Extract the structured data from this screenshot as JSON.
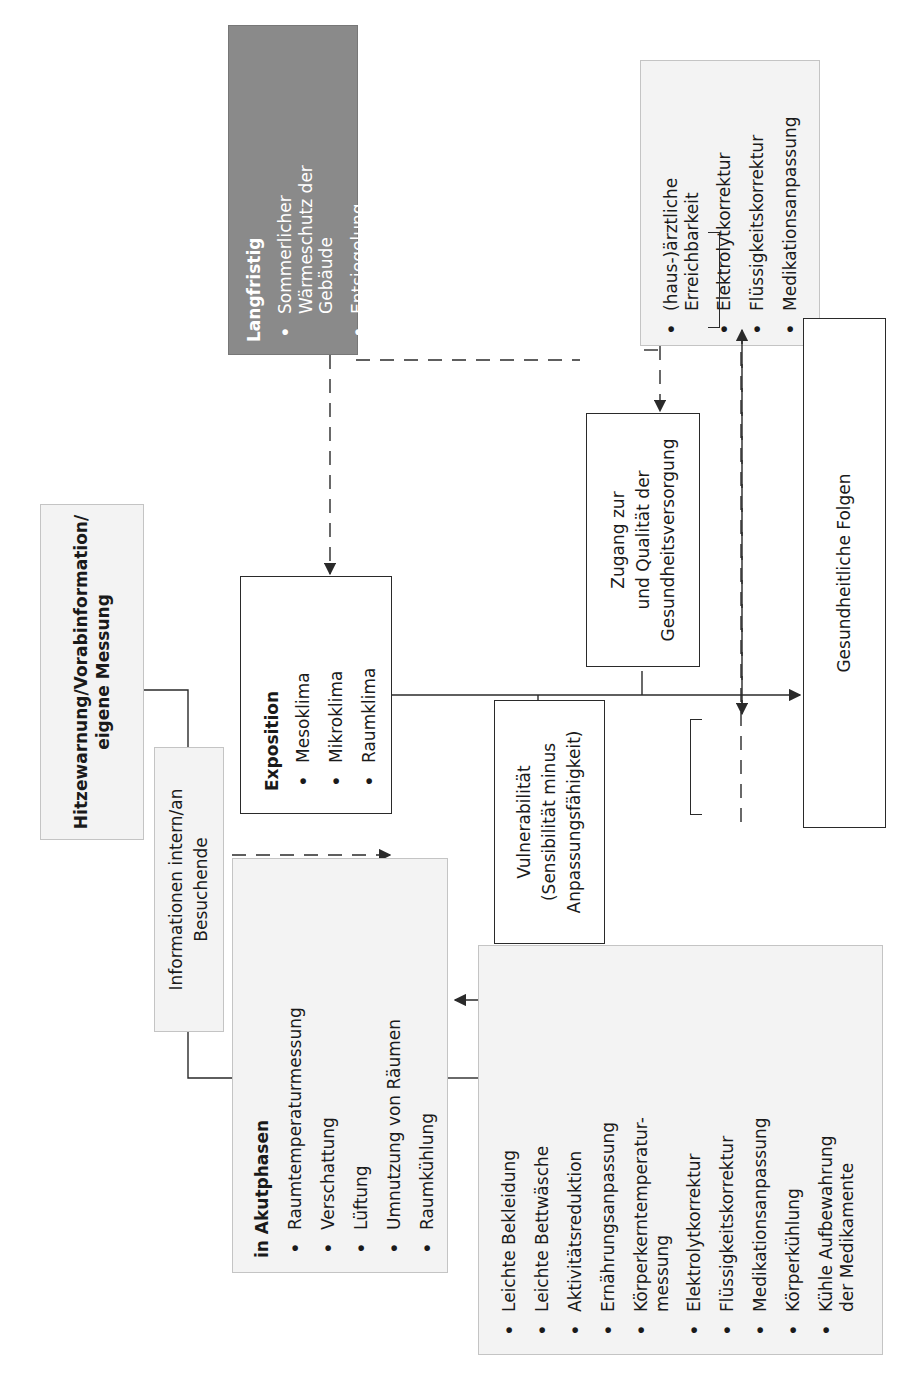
{
  "diagram": {
    "orientation": "rotated 90 degrees counter-clockwise",
    "colors": {
      "grey_box_fill": "#f3f3f3",
      "dark_box_fill": "#8a8a8a",
      "line": "#2a2a2a"
    },
    "heat_warning": {
      "label": "Hitzewarnung/Vorabinformation/\neigene Messung"
    },
    "information": {
      "label": "Informationen intern/an\nBesuchende"
    },
    "acute_phases": {
      "title": "in Akutphasen",
      "items": [
        "Raumtemperaturmessung",
        "Verschattung",
        "Lüftung",
        "Umnutzung von Räumen",
        "Raumkühlung"
      ]
    },
    "personal_measures": {
      "items": [
        {
          "text": "Leichte Bekleidung"
        },
        {
          "text": "Leichte Bettwäsche"
        },
        {
          "text": "Aktivitätsreduktion"
        },
        {
          "text": "Ernährungsanpassung"
        },
        {
          "text": "Körperkerntemperatur-",
          "continuation": "messung"
        },
        {
          "text": "Elektrolytkorrektur"
        },
        {
          "text": "Flüssigkeitskorrektur"
        },
        {
          "text": "Medikationsanpassung"
        },
        {
          "text": "Körperkühlung"
        },
        {
          "text": "Kühle Aufbewahrung",
          "continuation": "der Medikamente"
        }
      ]
    },
    "long_term": {
      "title": "Langfristig",
      "items": [
        {
          "text": "Sommerlicher",
          "continuation": "Wärmeschutz der\nGebäude"
        },
        {
          "text": "Entsiegelung"
        },
        {
          "text": "Begrünung"
        },
        {
          "text_prefix": "CO",
          "subscript": "2",
          "text_suffix": "-neutrale",
          "continuation": "Klimatisierung"
        }
      ]
    },
    "exposition": {
      "title": "Exposition",
      "items": [
        "Mesoklima",
        "Mikroklima",
        "Raumklima"
      ]
    },
    "vulnerability": {
      "label": "Vulnerabilität\n(Sensibilität minus\nAnpassungsfähigkeit)"
    },
    "healthcare_access": {
      "label": "Zugang zur\nund Qualität der\nGesundheitsversorgung"
    },
    "medical_availability": {
      "items": [
        {
          "text": "(haus-)ärztliche",
          "continuation": "Erreichbarkeit"
        },
        {
          "text": "Elektrolytkorrektur"
        },
        {
          "text": "Flüssigkeitskorrektur"
        },
        {
          "text": "Medikationsanpassung"
        }
      ]
    },
    "health_consequences": {
      "label": "Gesundheitliche Folgen"
    }
  }
}
